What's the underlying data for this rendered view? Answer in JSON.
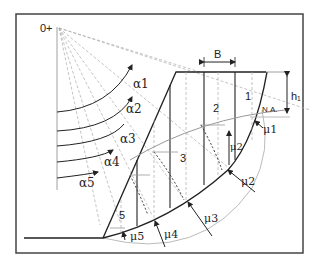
{
  "diagram": {
    "type": "slope-stability-method-of-slices",
    "origin_label": "0+",
    "width_label": "B",
    "height_label": "h₁",
    "neutral_axis_label": "N.A.",
    "slice_labels": [
      "1",
      "2",
      "3",
      "5"
    ],
    "alpha_labels": [
      "α1",
      "α2",
      "α3",
      "α4",
      "α5"
    ],
    "mu_labels": [
      "μ1",
      "μ2",
      "μ3",
      "μ4",
      "μ5"
    ],
    "mu2_inner_label": "μ2",
    "colors": {
      "frame": "#444444",
      "line": "#222222",
      "dashed": "#999999",
      "circle": "#aaaaaa"
    }
  }
}
